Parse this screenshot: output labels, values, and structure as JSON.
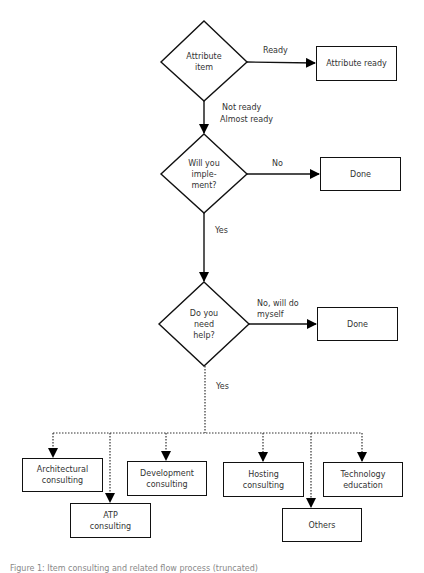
{
  "flowchart": {
    "decisions": [
      {
        "id": "attribute",
        "label": "Attribute\nitem"
      },
      {
        "id": "implement",
        "label": "Will you\nimple-\nment?"
      },
      {
        "id": "help",
        "label": "Do you\nneed\nhelp?"
      }
    ],
    "outcomes": [
      {
        "id": "attribute_ready",
        "label": "Attribute ready"
      },
      {
        "id": "done_1",
        "label": "Done"
      },
      {
        "id": "done_2",
        "label": "Done"
      }
    ],
    "edge_labels": {
      "ready": "Ready",
      "not_ready": "Not ready",
      "almost_ready": "Almost ready",
      "no": "No",
      "yes_1": "Yes",
      "no_will_do_myself": "No, will do\nmyself",
      "yes_2": "Yes"
    },
    "services": [
      {
        "id": "architectural",
        "label": "Architectural\nconsulting"
      },
      {
        "id": "atp",
        "label": "ATP\nconsulting"
      },
      {
        "id": "development",
        "label": "Development\nconsulting"
      },
      {
        "id": "hosting",
        "label": "Hosting\nconsulting"
      },
      {
        "id": "others",
        "label": "Others"
      },
      {
        "id": "technology",
        "label": "Technology\neducation"
      }
    ]
  },
  "caption": "Figure 1: Item consulting and related flow process (truncated)"
}
